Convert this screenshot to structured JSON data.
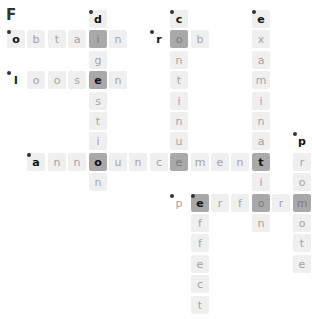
{
  "puzzle": {
    "title": "F",
    "grid": {
      "origin_x": 7,
      "origin_y": 10,
      "pitch": 20.4,
      "cell_size": 18
    },
    "colors": {
      "cell_bg": "#efefef",
      "highlight_bg": "#a9a9a9",
      "letter": "#a3a3a3",
      "start_letter": "#111111"
    },
    "words": [
      {
        "word": "obtain",
        "direction": "across",
        "row": 1,
        "col": 0
      },
      {
        "word": "loosen",
        "direction": "across",
        "row": 3,
        "col": 0
      },
      {
        "word": "rob",
        "direction": "across",
        "row": 1,
        "col": 7
      },
      {
        "word": "announcement",
        "direction": "across",
        "row": 7,
        "col": 1
      },
      {
        "word": "perform",
        "direction": "across",
        "row": 9,
        "col": 8
      },
      {
        "word": "digestion",
        "direction": "down",
        "row": 0,
        "col": 4
      },
      {
        "word": "continue",
        "direction": "down",
        "row": 0,
        "col": 8
      },
      {
        "word": "examination",
        "direction": "down",
        "row": 0,
        "col": 12
      },
      {
        "word": "promote",
        "direction": "down",
        "row": 6,
        "col": 14
      },
      {
        "word": "effect",
        "direction": "down",
        "row": 9,
        "col": 9
      }
    ],
    "cells": [
      {
        "r": 0,
        "c": 4,
        "ch": "d",
        "start": true
      },
      {
        "r": 0,
        "c": 8,
        "ch": "c",
        "start": true
      },
      {
        "r": 0,
        "c": 12,
        "ch": "e",
        "start": true
      },
      {
        "r": 1,
        "c": 0,
        "ch": "o",
        "start": true
      },
      {
        "r": 1,
        "c": 1,
        "ch": "b"
      },
      {
        "r": 1,
        "c": 2,
        "ch": "t"
      },
      {
        "r": 1,
        "c": 3,
        "ch": "a"
      },
      {
        "r": 1,
        "c": 4,
        "ch": "i",
        "hl": true
      },
      {
        "r": 1,
        "c": 5,
        "ch": "n"
      },
      {
        "r": 1,
        "c": 7,
        "ch": "r",
        "start": true,
        "bare": true
      },
      {
        "r": 1,
        "c": 8,
        "ch": "o",
        "hl": true
      },
      {
        "r": 1,
        "c": 9,
        "ch": "b"
      },
      {
        "r": 1,
        "c": 12,
        "ch": "x"
      },
      {
        "r": 2,
        "c": 4,
        "ch": "g"
      },
      {
        "r": 2,
        "c": 8,
        "ch": "n"
      },
      {
        "r": 2,
        "c": 12,
        "ch": "a"
      },
      {
        "r": 3,
        "c": 0,
        "ch": "l",
        "start": true,
        "bare": true
      },
      {
        "r": 3,
        "c": 1,
        "ch": "o"
      },
      {
        "r": 3,
        "c": 2,
        "ch": "o"
      },
      {
        "r": 3,
        "c": 3,
        "ch": "s"
      },
      {
        "r": 3,
        "c": 4,
        "ch": "e",
        "hl": true,
        "strong": true
      },
      {
        "r": 3,
        "c": 5,
        "ch": "n"
      },
      {
        "r": 3,
        "c": 8,
        "ch": "t"
      },
      {
        "r": 3,
        "c": 12,
        "ch": "m"
      },
      {
        "r": 4,
        "c": 4,
        "ch": "s"
      },
      {
        "r": 4,
        "c": 8,
        "ch": "i"
      },
      {
        "r": 4,
        "c": 12,
        "ch": "i"
      },
      {
        "r": 5,
        "c": 4,
        "ch": "t"
      },
      {
        "r": 5,
        "c": 8,
        "ch": "n"
      },
      {
        "r": 5,
        "c": 12,
        "ch": "n"
      },
      {
        "r": 6,
        "c": 4,
        "ch": "i"
      },
      {
        "r": 6,
        "c": 8,
        "ch": "u"
      },
      {
        "r": 6,
        "c": 12,
        "ch": "a"
      },
      {
        "r": 6,
        "c": 14,
        "ch": "p",
        "start": true,
        "bare": true
      },
      {
        "r": 7,
        "c": 1,
        "ch": "a",
        "start": true
      },
      {
        "r": 7,
        "c": 2,
        "ch": "n"
      },
      {
        "r": 7,
        "c": 3,
        "ch": "n"
      },
      {
        "r": 7,
        "c": 4,
        "ch": "o",
        "hl": true,
        "strong": true
      },
      {
        "r": 7,
        "c": 5,
        "ch": "u"
      },
      {
        "r": 7,
        "c": 6,
        "ch": "n"
      },
      {
        "r": 7,
        "c": 7,
        "ch": "c"
      },
      {
        "r": 7,
        "c": 8,
        "ch": "e",
        "hl": true
      },
      {
        "r": 7,
        "c": 9,
        "ch": "m"
      },
      {
        "r": 7,
        "c": 10,
        "ch": "e"
      },
      {
        "r": 7,
        "c": 11,
        "ch": "n"
      },
      {
        "r": 7,
        "c": 12,
        "ch": "t",
        "hl": true,
        "strong": true
      },
      {
        "r": 7,
        "c": 14,
        "ch": "r"
      },
      {
        "r": 8,
        "c": 4,
        "ch": "n"
      },
      {
        "r": 8,
        "c": 12,
        "ch": "i"
      },
      {
        "r": 8,
        "c": 14,
        "ch": "o"
      },
      {
        "r": 9,
        "c": 8,
        "ch": "p",
        "start": true,
        "bare": true,
        "light": true
      },
      {
        "r": 9,
        "c": 9,
        "ch": "e",
        "hl": true,
        "strong": true,
        "start": true
      },
      {
        "r": 9,
        "c": 10,
        "ch": "r"
      },
      {
        "r": 9,
        "c": 11,
        "ch": "f"
      },
      {
        "r": 9,
        "c": 12,
        "ch": "o",
        "hl": true
      },
      {
        "r": 9,
        "c": 13,
        "ch": "r"
      },
      {
        "r": 9,
        "c": 14,
        "ch": "m",
        "hl": true
      },
      {
        "r": 10,
        "c": 9,
        "ch": "f"
      },
      {
        "r": 10,
        "c": 12,
        "ch": "n"
      },
      {
        "r": 10,
        "c": 14,
        "ch": "o"
      },
      {
        "r": 11,
        "c": 9,
        "ch": "f"
      },
      {
        "r": 11,
        "c": 14,
        "ch": "t"
      },
      {
        "r": 12,
        "c": 9,
        "ch": "e"
      },
      {
        "r": 12,
        "c": 14,
        "ch": "e"
      },
      {
        "r": 13,
        "c": 9,
        "ch": "c"
      },
      {
        "r": 14,
        "c": 9,
        "ch": "t"
      }
    ]
  }
}
